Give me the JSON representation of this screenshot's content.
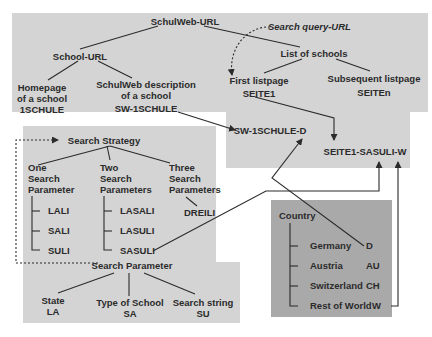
{
  "colors": {
    "region_light": "#d4d4d4",
    "region_dark": "#a9a9a9",
    "line": "#2b2b2b",
    "text": "#2b2b2b"
  },
  "url_tree": {
    "root": "SchulWeb-URL",
    "school_url": "School-URL",
    "homepage": [
      "Homepage",
      "of a school",
      "1SCHULE"
    ],
    "description": [
      "SchulWeb description",
      "of a school",
      "SW-1SCHULE"
    ],
    "search_query_label": "Search query-URL",
    "list_of_schools": "List of schools",
    "first_listpage": [
      "First listpage",
      "SEITE1"
    ],
    "subsequent_listpage": [
      "Subsequent listpage",
      "SEITEn"
    ],
    "sw_1schule_d": "SW-1SCHULE-D",
    "seite1_sasuli_w": "SEITE1-SASULI-W"
  },
  "search_strategy": {
    "title": "Search Strategy",
    "groups": [
      {
        "heading": [
          "One",
          "Search",
          "Parameter"
        ],
        "items": [
          "LALI",
          "SALI",
          "SULI"
        ]
      },
      {
        "heading": [
          "Two",
          "Search",
          "Parameters"
        ],
        "items": [
          "LASALI",
          "LASULI",
          "SASULI"
        ]
      },
      {
        "heading": [
          "Three",
          "Search",
          "Parameters"
        ],
        "items": [
          "DREILI"
        ]
      }
    ]
  },
  "search_parameter": {
    "title": "Search Parameter",
    "params": [
      {
        "name": "State",
        "code": "LA"
      },
      {
        "name": "Type of School",
        "code": "SA"
      },
      {
        "name": "Search string",
        "code": "SU"
      }
    ]
  },
  "country": {
    "title": "Country",
    "items": [
      {
        "name": "Germany",
        "code": "D"
      },
      {
        "name": "Austria",
        "code": "AU"
      },
      {
        "name": "Switzerland",
        "code": "CH"
      },
      {
        "name": "Rest of World",
        "code": "W"
      }
    ]
  }
}
